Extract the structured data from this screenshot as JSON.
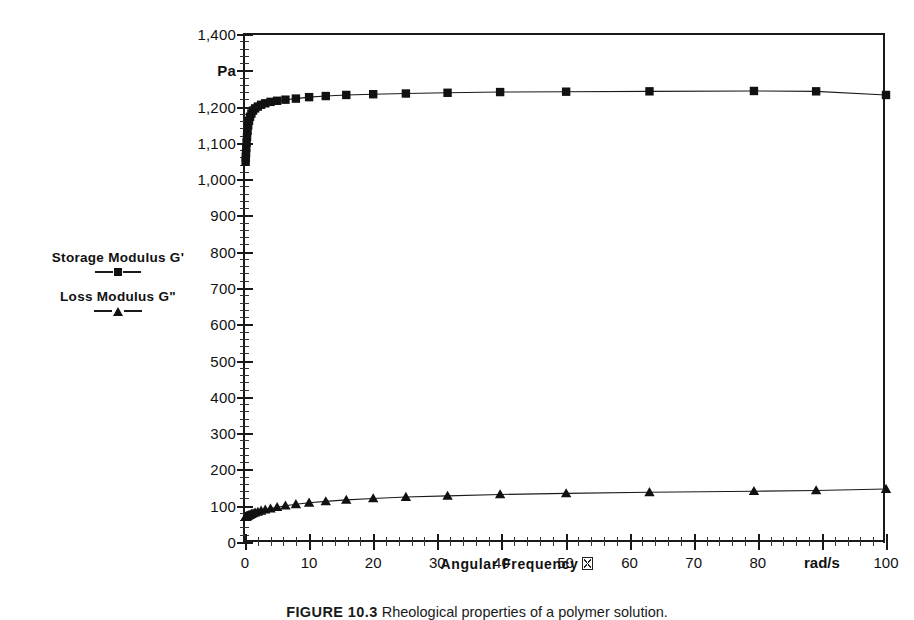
{
  "chart_data": {
    "type": "line",
    "title": "",
    "xlabel": "Angular Frequency",
    "xlabel_unit_glyph": "missing-omega-box",
    "ylabel": "",
    "x_unit": "rad/s",
    "y_unit": "Pa",
    "xlim": [
      0,
      100
    ],
    "ylim": [
      0,
      1400
    ],
    "x_major_step": 10,
    "x_minor_step": 2,
    "y_major_step": 100,
    "y_minor_step": 20,
    "grid": false,
    "legend_position": "left-outside",
    "x_tick_labels": [
      "0",
      "10",
      "20",
      "30",
      "40",
      "50",
      "60",
      "70",
      "80",
      "rad/s",
      "100"
    ],
    "y_tick_labels": [
      "0",
      "100",
      "200",
      "300",
      "400",
      "500",
      "600",
      "700",
      "800",
      "900",
      "1,000",
      "1,100",
      "1,200",
      "Pa",
      "1,400"
    ],
    "series": [
      {
        "name": "Storage Modulus G'",
        "marker": "square",
        "x": [
          0.1,
          0.13,
          0.16,
          0.2,
          0.25,
          0.32,
          0.4,
          0.5,
          0.63,
          0.79,
          1.0,
          1.26,
          1.58,
          2.0,
          2.51,
          3.16,
          3.98,
          5.01,
          6.31,
          7.94,
          10.0,
          12.6,
          15.8,
          20.0,
          25.1,
          31.6,
          39.8,
          50.1,
          63.1,
          79.4,
          89.1,
          100.0
        ],
        "values": [
          1048,
          1060,
          1072,
          1086,
          1101,
          1117,
          1133,
          1148,
          1161,
          1172,
          1181,
          1189,
          1195,
          1200,
          1205,
          1209,
          1213,
          1216,
          1219,
          1222,
          1226,
          1229,
          1232,
          1234,
          1236,
          1238,
          1240,
          1241,
          1242,
          1243,
          1242,
          1232
        ]
      },
      {
        "name": "Loss Modulus G\"",
        "marker": "triangle",
        "x": [
          0.1,
          0.13,
          0.16,
          0.2,
          0.25,
          0.32,
          0.4,
          0.5,
          0.63,
          0.79,
          1.0,
          1.26,
          1.58,
          2.0,
          2.51,
          3.16,
          3.98,
          5.01,
          6.31,
          7.94,
          10.0,
          12.6,
          15.8,
          20.0,
          25.1,
          31.6,
          39.8,
          50.1,
          63.1,
          79.4,
          89.1,
          100.0
        ],
        "values": [
          69,
          69,
          70,
          70,
          71,
          71,
          72,
          73,
          74,
          75,
          77,
          79,
          81,
          83,
          86,
          89,
          92,
          96,
          100,
          104,
          108,
          112,
          116,
          120,
          124,
          127,
          131,
          134,
          137,
          140,
          142,
          146
        ]
      }
    ]
  },
  "legend": {
    "entries": [
      {
        "label": "Storage Modulus G'",
        "marker": "square"
      },
      {
        "label": "Loss Modulus G\"",
        "marker": "triangle"
      }
    ]
  },
  "axis": {
    "x_title": "Angular Frequency"
  },
  "caption": {
    "figure_number": "FIGURE 10.3",
    "text": "Rheological properties of a polymer solution."
  }
}
